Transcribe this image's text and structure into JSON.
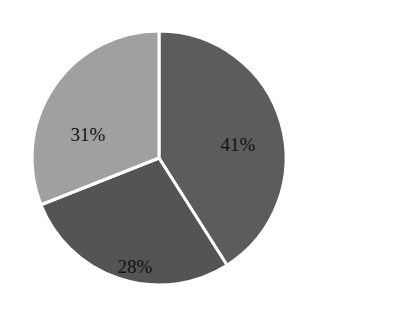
{
  "chart_data": {
    "type": "pie",
    "title": "",
    "categories": [
      "Slice A",
      "Slice B",
      "Slice C"
    ],
    "values": [
      41,
      28,
      31
    ],
    "labels": [
      "41%",
      "28%",
      "31%"
    ],
    "colors": [
      "#5c5c5c",
      "#545454",
      "#a0a0a0"
    ],
    "start_angle_deg": -90,
    "direction": "clockwise",
    "separator_color": "#ffffff",
    "legend": "none"
  },
  "layout": {
    "cx": 159,
    "cy": 158,
    "r": 127,
    "label_positions": [
      {
        "x": 238,
        "y": 147
      },
      {
        "x": 135,
        "y": 269
      },
      {
        "x": 88,
        "y": 137
      }
    ]
  }
}
